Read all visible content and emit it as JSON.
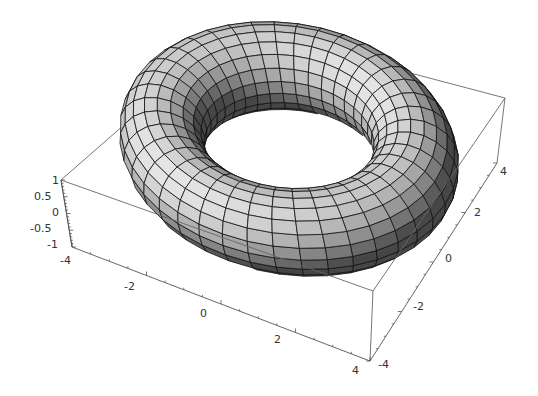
{
  "chart_data": {
    "type": "surface3d",
    "title": "",
    "surface": "torus",
    "parameters": {
      "major_radius": 3,
      "minor_radius": 1,
      "u_segments": 40,
      "v_segments": 20
    },
    "axes": {
      "x": {
        "range": [
          -4,
          4
        ],
        "ticks": [
          "-4",
          "-2",
          "0",
          "2",
          "4"
        ]
      },
      "y": {
        "range": [
          -4,
          4
        ],
        "ticks": [
          "-4",
          "-2",
          "0",
          "2",
          "4"
        ]
      },
      "z": {
        "range": [
          -1,
          1
        ],
        "ticks": [
          "1",
          "0.5",
          "0",
          "-0.5",
          "-1"
        ]
      }
    },
    "boxed": true,
    "grid": false,
    "legend": null,
    "colors": {
      "surface_light": "#d8d8d8",
      "surface_dark": "#5a5a5a",
      "mesh": "#111111",
      "box": "#666666"
    }
  },
  "labels": {
    "z": [
      {
        "text": "1",
        "x": 52,
        "y": 184
      },
      {
        "text": "0.5",
        "x": 34,
        "y": 200
      },
      {
        "text": "0",
        "x": 52,
        "y": 216
      },
      {
        "text": "-0.5",
        "x": 30,
        "y": 232
      },
      {
        "text": "-1",
        "x": 47,
        "y": 248
      }
    ],
    "x": [
      {
        "text": "-4",
        "x": 60,
        "y": 264
      },
      {
        "text": "-2",
        "x": 124,
        "y": 290
      },
      {
        "text": "0",
        "x": 200,
        "y": 317
      },
      {
        "text": "2",
        "x": 274,
        "y": 343
      },
      {
        "text": "4",
        "x": 352,
        "y": 374
      }
    ],
    "y": [
      {
        "text": "-4",
        "x": 378,
        "y": 368
      },
      {
        "text": "-2",
        "x": 413,
        "y": 310
      },
      {
        "text": "0",
        "x": 445,
        "y": 262
      },
      {
        "text": "2",
        "x": 474,
        "y": 216
      },
      {
        "text": "4",
        "x": 500,
        "y": 175
      }
    ]
  }
}
